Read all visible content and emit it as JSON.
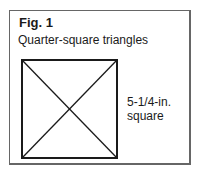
{
  "figure": {
    "label": "Fig. 1",
    "title": "Quarter-square triangles",
    "dimension_line1": "5-1/4-in.",
    "dimension_line2": "square",
    "shape": "square divided by two diagonals into four triangles"
  }
}
